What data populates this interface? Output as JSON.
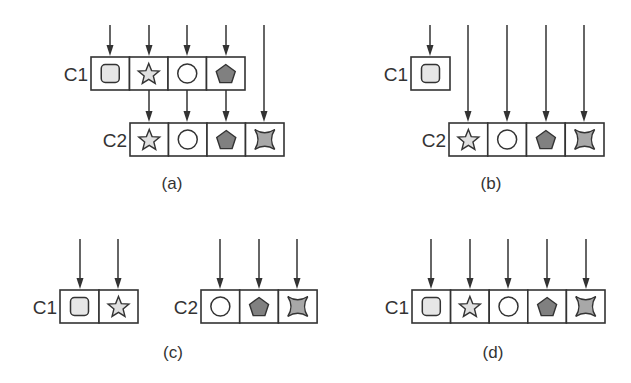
{
  "figure": {
    "width": 631,
    "height": 383,
    "colors": {
      "stroke": "#333333",
      "square_fill": "#e6e6e6",
      "star_fill": "#e0e0e0",
      "circle_fill": "#ffffff",
      "pentagon_fill": "#808080",
      "four_point_star_fill": "#a8a8a8"
    },
    "panels": [
      {
        "id": "a",
        "caption": "(a)",
        "caption_pos": [
          172,
          189
        ],
        "containers": [
          {
            "label": "C1",
            "x": 91,
            "y": 57,
            "cell_w": 38.5,
            "h": 33,
            "cells": [
              "square",
              "star",
              "circle",
              "pentagon"
            ]
          },
          {
            "label": "C2",
            "x": 130,
            "y": 123,
            "cell_w": 38.5,
            "h": 33,
            "cells": [
              "star",
              "circle",
              "pentagon",
              "four-point-star"
            ]
          }
        ],
        "arrows": [
          {
            "x": 110,
            "y1": 25,
            "y2": 56
          },
          {
            "x": 149,
            "y1": 25,
            "y2": 56
          },
          {
            "x": 187,
            "y1": 25,
            "y2": 56
          },
          {
            "x": 226,
            "y1": 25,
            "y2": 56
          },
          {
            "x": 149,
            "y1": 90,
            "y2": 122
          },
          {
            "x": 187,
            "y1": 90,
            "y2": 122
          },
          {
            "x": 226,
            "y1": 90,
            "y2": 122
          },
          {
            "x": 264,
            "y1": 25,
            "y2": 122
          }
        ]
      },
      {
        "id": "b",
        "caption": "(b)",
        "caption_pos": [
          491,
          189
        ],
        "containers": [
          {
            "label": "C1",
            "x": 411,
            "y": 57,
            "cell_w": 39,
            "h": 33,
            "cells": [
              "square"
            ]
          },
          {
            "label": "C2",
            "x": 449,
            "y": 123,
            "cell_w": 38.75,
            "h": 33,
            "cells": [
              "star",
              "circle",
              "pentagon",
              "four-point-star"
            ]
          }
        ],
        "arrows": [
          {
            "x": 430,
            "y1": 25,
            "y2": 56
          },
          {
            "x": 468,
            "y1": 25,
            "y2": 122
          },
          {
            "x": 507,
            "y1": 25,
            "y2": 122
          },
          {
            "x": 546,
            "y1": 25,
            "y2": 122
          },
          {
            "x": 584,
            "y1": 25,
            "y2": 122
          }
        ]
      },
      {
        "id": "c",
        "caption": "(c)",
        "caption_pos": [
          173,
          358
        ],
        "containers": [
          {
            "label": "C1",
            "x": 60,
            "y": 290,
            "cell_w": 39,
            "h": 33,
            "cells": [
              "square",
              "star"
            ]
          },
          {
            "label": "C2",
            "x": 201,
            "y": 290,
            "cell_w": 38.7,
            "h": 33,
            "cells": [
              "circle",
              "pentagon",
              "four-point-star"
            ]
          }
        ],
        "arrows": [
          {
            "x": 80,
            "y1": 239,
            "y2": 289
          },
          {
            "x": 118,
            "y1": 239,
            "y2": 289
          },
          {
            "x": 220,
            "y1": 239,
            "y2": 289
          },
          {
            "x": 259,
            "y1": 239,
            "y2": 289
          },
          {
            "x": 297,
            "y1": 239,
            "y2": 289
          }
        ]
      },
      {
        "id": "d",
        "caption": "(d)",
        "caption_pos": [
          493,
          358
        ],
        "containers": [
          {
            "label": "C1",
            "x": 412,
            "y": 290,
            "cell_w": 38.6,
            "h": 33,
            "cells": [
              "square",
              "star",
              "circle",
              "pentagon",
              "four-point-star"
            ]
          }
        ],
        "arrows": [
          {
            "x": 431,
            "y1": 239,
            "y2": 289
          },
          {
            "x": 470,
            "y1": 239,
            "y2": 289
          },
          {
            "x": 508,
            "y1": 239,
            "y2": 289
          },
          {
            "x": 547,
            "y1": 239,
            "y2": 289
          },
          {
            "x": 586,
            "y1": 239,
            "y2": 289
          }
        ]
      }
    ]
  }
}
